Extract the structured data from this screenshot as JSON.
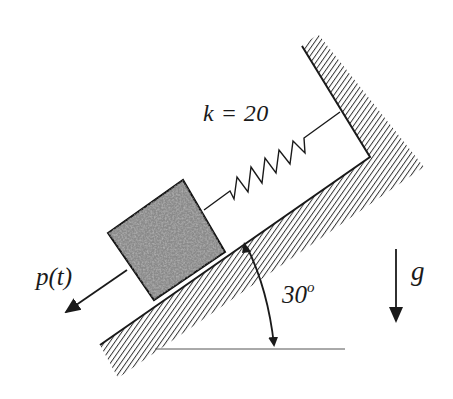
{
  "diagram": {
    "labels": {
      "spring_stiffness": "k = 20",
      "force": "p(t)",
      "angle_value": "30",
      "angle_unit": "o",
      "gravity": "g"
    },
    "elements": {
      "incline_angle_deg": 30,
      "spring_constant": 20,
      "block_fill": "#8a8a8a",
      "line_color": "#1a1a1a",
      "hatch_color": "#333333"
    }
  }
}
